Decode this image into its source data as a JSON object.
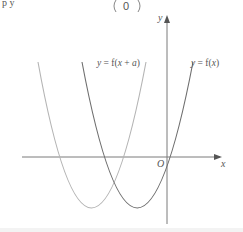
{
  "header": {
    "vector_fragment": "0",
    "left_fragment": "p  y"
  },
  "axes": {
    "x_label": "x",
    "y_label": "y",
    "origin_label": "O"
  },
  "curves": [
    {
      "name": "f(x)",
      "label": "y = f(x)",
      "color": "#6e6e6e"
    },
    {
      "name": "f(x+a)",
      "label": "y = f(x + a)",
      "color": "#b4b4b4"
    }
  ],
  "colors": {
    "axis": "#7a7a7a",
    "text": "#555555"
  }
}
